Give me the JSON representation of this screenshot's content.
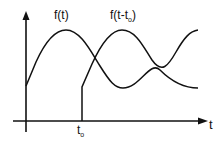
{
  "diagram": {
    "curve1_label": "f(t)",
    "curve2_label_main": "f(t-t",
    "curve2_label_sub": "o",
    "curve2_label_close": ")",
    "x_axis_label": "t",
    "shift_label_main": "t",
    "shift_label_sub": "o",
    "stroke_color": "#111111",
    "background": "#ffffff"
  }
}
